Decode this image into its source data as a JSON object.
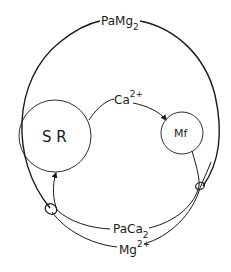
{
  "diagram": {
    "labels": {
      "outer_path": "PaMg",
      "outer_path_sub": "2",
      "sr": "S R",
      "mf": "Mf",
      "calcium": "Ca",
      "calcium_sup": "2+",
      "paca": "PaCa",
      "paca_sub": "2",
      "magnesium": "Mg",
      "magnesium_sup": "2+"
    },
    "nodes": [
      {
        "id": "sr",
        "label": "S R"
      },
      {
        "id": "mf",
        "label": "Mf"
      }
    ],
    "edges": [
      {
        "from": "sr",
        "to": "mf",
        "label": "Ca2+",
        "arrow": true
      },
      {
        "from": "mf",
        "to": "sr",
        "label": "PaCa2",
        "arrow": true
      },
      {
        "from": "left-junction",
        "to": "right-junction",
        "label": "Mg2+"
      },
      {
        "from": "left-junction",
        "to": "right-junction",
        "label": "PaMg2",
        "via": "outer loop"
      }
    ]
  }
}
